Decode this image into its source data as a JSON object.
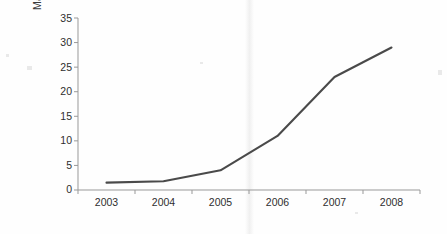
{
  "chart_data": {
    "type": "line",
    "title": "",
    "subtitle": "",
    "xlabel": "",
    "ylabel": "Market Share (%)",
    "categories": [
      "2003",
      "2004",
      "2005",
      "2006",
      "2007",
      "2008"
    ],
    "values": [
      1.5,
      1.8,
      4,
      11,
      23,
      29
    ],
    "series": [
      {
        "name": "Market Share",
        "values": [
          1.5,
          1.8,
          4,
          11,
          23,
          29
        ]
      }
    ],
    "ylim": [
      0,
      35
    ],
    "ytick_labels": [
      "0",
      "5",
      "10",
      "15",
      "20",
      "25",
      "30",
      "35"
    ],
    "ytick_values": [
      0,
      5,
      10,
      15,
      20,
      25,
      30,
      35
    ],
    "xtick_labels": [
      "2003",
      "2004",
      "2005",
      "2006",
      "2007",
      "2008"
    ],
    "grid": false,
    "legend": false,
    "legend_position": "none",
    "line_color": "#4a4a4a",
    "axis_color": "#999999",
    "text_color": "#2e2e2e",
    "background_color": "#fefefe",
    "markers": false,
    "line_width": 2.1
  },
  "axes": {
    "y_axis_name": "y-axis",
    "x_axis_name": "x-axis"
  }
}
